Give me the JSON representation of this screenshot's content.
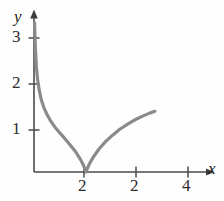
{
  "figure": {
    "background_color": "#fefefe",
    "curve_color": "#8a8a8a",
    "axis_color": "#4a4a4a",
    "text_color": "#2b2b2b"
  },
  "axes": {
    "x_name": "x",
    "y_name": "y",
    "x_tick_labels": [
      "2",
      "2",
      "4"
    ],
    "y_tick_labels": [
      "1",
      "2",
      "3"
    ]
  },
  "chart_data": {
    "type": "line",
    "title": "",
    "subtitle": "",
    "xlabel": "x",
    "ylabel": "y",
    "xlim": [
      0,
      4.8
    ],
    "ylim": [
      0,
      3.4
    ],
    "grid": false,
    "legend": null,
    "xticks": [
      2,
      3,
      4
    ],
    "xticklabels": [
      "2",
      "2",
      "4"
    ],
    "yticks": [
      1,
      2,
      3
    ],
    "yticklabels": [
      "1",
      "2",
      "3"
    ],
    "annotations": [],
    "series": [
      {
        "name": "curve",
        "color": "#8a8a8a",
        "x": [
          0.02,
          0.05,
          0.09,
          0.14,
          0.2,
          0.28,
          0.38,
          0.5,
          0.64,
          0.8,
          0.98,
          1.18,
          1.4,
          1.6,
          1.78,
          1.9,
          1.96,
          2.0,
          2.06,
          2.16,
          2.3,
          2.5,
          2.75,
          3.0,
          3.3,
          3.6,
          3.9,
          4.2,
          4.45,
          4.65
        ],
        "y": [
          3.25,
          2.72,
          2.3,
          2.0,
          1.78,
          1.57,
          1.4,
          1.25,
          1.11,
          0.98,
          0.86,
          0.73,
          0.58,
          0.44,
          0.28,
          0.15,
          0.07,
          0.0,
          0.09,
          0.21,
          0.34,
          0.5,
          0.66,
          0.79,
          0.93,
          1.04,
          1.14,
          1.22,
          1.28,
          1.32
        ]
      }
    ]
  }
}
